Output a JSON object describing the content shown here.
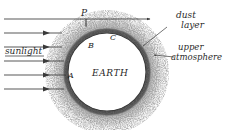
{
  "figure": {
    "type": "scientific-diagram",
    "background_color": "#ffffff",
    "ink_color": "#2b2b2b",
    "style": "hand-drawn pencil sketch"
  },
  "labels": {
    "sunlight": "sunlight",
    "dust_layer_line1": "dust",
    "dust_layer_line2": "layer",
    "upper_atmosphere_line1": "upper",
    "upper_atmosphere_line2": "atmosphere",
    "earth": "EARTH",
    "point_p": "P",
    "point_a": "A",
    "point_b": "B",
    "point_c": "C"
  },
  "earth": {
    "center_x": 107,
    "center_y": 72,
    "radius": 39,
    "fill_color": "#ffffff",
    "outline_color": "#3a3a3a"
  },
  "dust_layer": {
    "inner_radius": 39,
    "outer_radius": 44,
    "color": "#555555",
    "description": "dark speckled ring immediately above the surface"
  },
  "upper_atmosphere": {
    "inner_radius": 44,
    "outer_radius": 62,
    "color": "#9a9a9a",
    "description": "diffuse stippled halo fading outward"
  },
  "sun_rays": {
    "count": 6,
    "direction": "left-to-right",
    "color": "#3a3a3a",
    "rays": [
      {
        "y": 19,
        "x_start": 4,
        "x_end": 150,
        "arrow_x": 150
      },
      {
        "y": 33,
        "x_start": 4,
        "x_end": 62,
        "arrow_x": 47
      },
      {
        "y": 47,
        "x_start": 4,
        "x_end": 62,
        "arrow_x": 47
      },
      {
        "y": 61,
        "x_start": 4,
        "x_end": 62,
        "arrow_x": 47
      },
      {
        "y": 75,
        "x_start": 4,
        "x_end": 62,
        "arrow_x": 47
      },
      {
        "y": 89,
        "x_start": 4,
        "x_end": 62,
        "arrow_x": 47
      }
    ]
  },
  "leader_lines": [
    {
      "name": "dust-layer-leader",
      "x1": 167,
      "y1": 27,
      "x2": 143,
      "y2": 46
    },
    {
      "name": "upper-atmosphere-leader",
      "x1": 172,
      "y1": 57,
      "x2": 153,
      "y2": 55
    }
  ],
  "point_markers": [
    {
      "name": "P",
      "x": 84,
      "y": 14,
      "tick_x": 86,
      "tick_y1": 19,
      "tick_y2": 26
    },
    {
      "name": "A",
      "x": 71,
      "y": 75
    },
    {
      "name": "B",
      "x": 90,
      "y": 46
    },
    {
      "name": "C",
      "x": 111,
      "y": 38
    }
  ]
}
